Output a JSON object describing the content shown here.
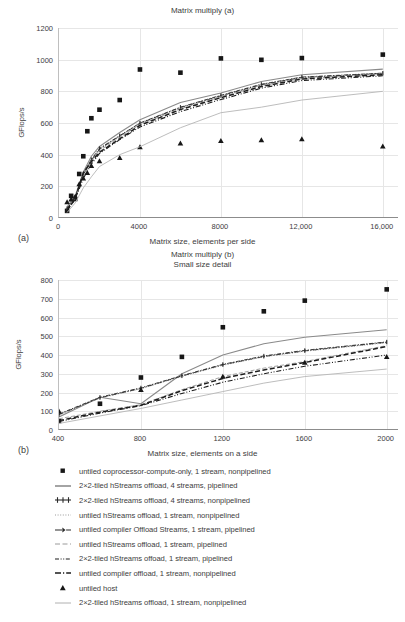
{
  "figure": {
    "panel_a_tag": "(a)",
    "panel_b_tag": "(b)"
  },
  "chart_data": [
    {
      "id": "matrix-multiply-a",
      "type": "scatter",
      "title": "Matrix multiply (a)",
      "xlabel": "Matrix size, elements per side",
      "ylabel": "GFlops/s",
      "xlim": [
        0,
        16800
      ],
      "ylim": [
        0,
        1200
      ],
      "xticks": [
        0,
        4000,
        8000,
        12000,
        16000
      ],
      "xticklabels": [
        "0",
        "4000",
        "8000",
        "12,000",
        "16,000"
      ],
      "yticks": [
        0,
        200,
        400,
        600,
        800,
        1000,
        1200
      ],
      "yticklabels": [
        "0",
        "200",
        "400",
        "600",
        "800",
        "1000",
        "1200"
      ],
      "grid": "y-and-x",
      "legend_position": "below-figure",
      "series": [
        {
          "name": "untiled coprocessor-compute-only, 1 stream, nonpipelined",
          "style": "marker-square",
          "x": [
            400,
            600,
            800,
            1000,
            1200,
            1400,
            1600,
            2000,
            3000,
            4000,
            6000,
            8000,
            10000,
            12000,
            16000
          ],
          "y": [
            45,
            140,
            120,
            278,
            390,
            548,
            630,
            684,
            745,
            938,
            918,
            1008,
            999,
            1010,
            1032,
            1013
          ]
        },
        {
          "name": "2×2-tiled hStreams offload, 4 streams, pipelined",
          "style": "solid-gray-thick",
          "x": [
            400,
            800,
            1200,
            1600,
            2000,
            3000,
            4000,
            6000,
            8000,
            10000,
            12000,
            16000
          ],
          "y": [
            70,
            140,
            290,
            390,
            452,
            540,
            620,
            730,
            790,
            862,
            905,
            940,
            975
          ]
        },
        {
          "name": "2×2-tiled hStreams offload, 4 streams, nonpipelined",
          "style": "dashdot-marker",
          "x": [
            400,
            800,
            1200,
            1600,
            2000,
            3000,
            4000,
            6000,
            8000,
            10000,
            12000,
            16000
          ],
          "y": [
            60,
            130,
            280,
            370,
            440,
            520,
            600,
            700,
            775,
            845,
            890,
            915,
            930
          ]
        },
        {
          "name": "untiled hStreams offload, 1 stream, nonpipelined",
          "style": "dotted-gray",
          "x": [
            400,
            800,
            1200,
            1600,
            2000,
            3000,
            4000,
            6000,
            8000,
            10000,
            12000,
            16000
          ],
          "y": [
            55,
            125,
            270,
            360,
            430,
            515,
            595,
            695,
            770,
            840,
            885,
            912,
            928
          ]
        },
        {
          "name": "untiled compiler Offload Streams, 1 stream, pipelined",
          "style": "dashdot-cross",
          "x": [
            400,
            800,
            1200,
            1600,
            2000,
            3000,
            4000,
            6000,
            8000,
            10000,
            12000,
            16000
          ],
          "y": [
            58,
            128,
            275,
            365,
            435,
            518,
            598,
            698,
            772,
            842,
            888,
            913,
            929
          ]
        },
        {
          "name": "untiled hStreams offload, 1 stream, pipelined",
          "style": "dashed-gray-thin",
          "x": [
            400,
            800,
            1200,
            1600,
            2000,
            3000,
            4000,
            6000,
            8000,
            10000,
            12000,
            16000
          ],
          "y": [
            52,
            122,
            265,
            355,
            425,
            510,
            590,
            690,
            765,
            835,
            880,
            908,
            925
          ]
        },
        {
          "name": "2×2-tiled hStreams offoad, 1 stream, pipelined",
          "style": "dashdotdot-black",
          "x": [
            400,
            800,
            1200,
            1600,
            2000,
            3000,
            4000,
            6000,
            8000,
            10000,
            12000,
            16000
          ],
          "y": [
            48,
            118,
            250,
            340,
            408,
            495,
            575,
            672,
            748,
            820,
            868,
            898,
            918
          ]
        },
        {
          "name": "untiled compiler offload, 1 stream, nonpipelined",
          "style": "dashed-black-thick",
          "x": [
            400,
            800,
            1200,
            1600,
            2000,
            3000,
            4000,
            6000,
            8000,
            10000,
            12000,
            16000
          ],
          "y": [
            50,
            120,
            285,
            355,
            415,
            500,
            585,
            685,
            760,
            830,
            878,
            905,
            922
          ]
        },
        {
          "name": "untiled host",
          "style": "marker-triangle",
          "x": [
            400,
            600,
            800,
            1000,
            1200,
            1400,
            1600,
            2000,
            3000,
            4000,
            6000,
            8000,
            10000,
            12000,
            16000
          ],
          "y": [
            100,
            118,
            135,
            215,
            250,
            285,
            330,
            360,
            380,
            448,
            472,
            487,
            492,
            498,
            453,
            503
          ]
        },
        {
          "name": "2×2-tiled hStreams offload, 1 stream, nonpipelined",
          "style": "solid-gray-thin",
          "x": [
            400,
            800,
            1200,
            1600,
            2000,
            3000,
            4000,
            6000,
            8000,
            10000,
            12000,
            16000
          ],
          "y": [
            35,
            95,
            190,
            260,
            325,
            400,
            450,
            570,
            665,
            700,
            745,
            800,
            855
          ]
        }
      ]
    },
    {
      "id": "matrix-multiply-b",
      "type": "scatter",
      "title": "Matrix multiply (b)\nSmall size detail",
      "xlabel": "Matrix size, elements on a side",
      "ylabel": "GFlops/s",
      "xlim": [
        400,
        2060
      ],
      "ylim": [
        0,
        800
      ],
      "xticks": [
        400,
        800,
        1200,
        1600,
        2000
      ],
      "xticklabels": [
        "400",
        "800",
        "1200",
        "1600",
        "2000"
      ],
      "yticks": [
        0,
        100,
        200,
        300,
        400,
        500,
        600,
        700,
        800
      ],
      "yticklabels": [
        "0",
        "100",
        "200",
        "300",
        "400",
        "500",
        "600",
        "700",
        "800"
      ],
      "grid": "y-and-x",
      "legend_position": "below-figure",
      "series": [
        {
          "name": "untiled coprocessor-compute-only, 1 stream, nonpipelined",
          "style": "marker-square",
          "x": [
            400,
            600,
            800,
            1000,
            1200,
            1400,
            1600,
            2000
          ],
          "y": [
            48,
            140,
            280,
            390,
            548,
            633,
            690,
            750
          ]
        },
        {
          "name": "2×2-tiled hStreams offload, 4 streams, pipelined",
          "style": "solid-gray-thick",
          "x": [
            400,
            600,
            800,
            1000,
            1200,
            1400,
            1600,
            2000
          ],
          "y": [
            70,
            175,
            140,
            300,
            400,
            460,
            495,
            535
          ]
        },
        {
          "name": "2×2-tiled hStreams offload, 4 streams, nonpipelined",
          "style": "dashdot-marker",
          "x": [
            400,
            600,
            800,
            1000,
            1200,
            1400,
            1600,
            2000
          ],
          "y": [
            85,
            175,
            225,
            290,
            350,
            395,
            425,
            470
          ]
        },
        {
          "name": "untiled hStreams offload, 1 stream, nonpipelined",
          "style": "dotted-gray",
          "x": [
            400,
            600,
            800,
            1000,
            1200,
            1400,
            1600,
            2000
          ],
          "y": [
            80,
            170,
            220,
            285,
            345,
            390,
            420,
            465
          ]
        },
        {
          "name": "untiled compiler Offload Streams, 1 stream, pipelined",
          "style": "dashdot-cross",
          "x": [
            400,
            600,
            800,
            1000,
            1200,
            1400,
            1600,
            2000
          ],
          "y": [
            82,
            172,
            222,
            288,
            348,
            392,
            422,
            468
          ]
        },
        {
          "name": "untiled hStreams offload, 1 stream, pipelined",
          "style": "dashed-gray-thin",
          "x": [
            400,
            600,
            800,
            1000,
            1200,
            1400,
            1600,
            2000
          ],
          "y": [
            60,
            100,
            135,
            215,
            285,
            330,
            365,
            450
          ]
        },
        {
          "name": "2×2-tiled hStreams offoad, 1 stream, pipelined",
          "style": "dashdotdot-black",
          "x": [
            400,
            600,
            800,
            1000,
            1200,
            1400,
            1600,
            2000
          ],
          "y": [
            45,
            90,
            130,
            195,
            255,
            300,
            340,
            400
          ]
        },
        {
          "name": "untiled compiler offload, 1 stream, nonpipelined",
          "style": "dashed-black-thick",
          "x": [
            400,
            600,
            800,
            1000,
            1200,
            1400,
            1600,
            2000
          ],
          "y": [
            50,
            95,
            132,
            210,
            275,
            320,
            360,
            445
          ]
        },
        {
          "name": "untiled host",
          "style": "marker-triangle",
          "x": [
            400,
            800,
            1200,
            1600,
            2000
          ],
          "y": [
            100,
            215,
            285,
            360,
            390
          ]
        },
        {
          "name": "2×2-tiled hStreams offload, 1 stream, nonpipelined",
          "style": "solid-gray-thin",
          "x": [
            400,
            600,
            800,
            1000,
            1200,
            1400,
            1600,
            2000
          ],
          "y": [
            35,
            75,
            115,
            160,
            205,
            250,
            285,
            325
          ]
        }
      ]
    }
  ],
  "legend": {
    "items": [
      {
        "marker": "square-marker-icon",
        "label": "untiled coprocessor-compute-only, 1 stream, nonpipelined"
      },
      {
        "marker": "solid-line-icon",
        "label": "2×2-tiled hStreams offload, 4 streams, pipelined"
      },
      {
        "marker": "dash-cross-line-icon",
        "label": "2×2-tiled hStreams offload, 4 streams, nonpipelined"
      },
      {
        "marker": "dotted-line-icon",
        "label": "untiled hStreams offload, 1 stream, nonpipelined"
      },
      {
        "marker": "dash-dot-arrow-icon",
        "label": "untiled compiler Offload Streams, 1 stream, pipelined"
      },
      {
        "marker": "dash-gray-line-icon",
        "label": "untiled hStreams offload, 1 stream, pipelined"
      },
      {
        "marker": "dash-dot-dot-line-icon",
        "label": "2×2-tiled hStreams offoad, 1 stream, pipelined"
      },
      {
        "marker": "dash-dot-line-icon",
        "label": "untiled compiler offload, 1 stream, nonpipelined"
      },
      {
        "marker": "triangle-marker-icon",
        "label": "untiled host"
      },
      {
        "marker": "solid-thin-line-icon",
        "label": "2×2-tiled hStreams offload, 1 stream, nonpipelined"
      }
    ]
  }
}
